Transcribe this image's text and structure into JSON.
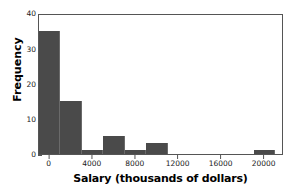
{
  "chart_data": {
    "type": "bar",
    "title": "",
    "subtitle": "",
    "xlabel": "Salary (thousands of dollars)",
    "ylabel": "Frequency",
    "xlim": [
      -1000,
      21800
    ],
    "ylim": [
      0,
      40
    ],
    "grid": false,
    "legend": null,
    "bin_width": 2000,
    "bar_color": "#4a4a4a",
    "frame_color": "#555555",
    "x_ticks": [
      0,
      4000,
      8000,
      12000,
      16000,
      20000
    ],
    "x_tick_labels": [
      "0",
      "4000",
      "8000",
      "12000",
      "16000",
      "20000"
    ],
    "y_ticks": [
      0,
      10,
      20,
      30,
      40
    ],
    "y_tick_labels": [
      "0",
      "10",
      "20",
      "30",
      "40"
    ],
    "bins": [
      {
        "start": -1000,
        "end": 1000,
        "value": 35
      },
      {
        "start": 1000,
        "end": 3000,
        "value": 15
      },
      {
        "start": 3000,
        "end": 5000,
        "value": 1
      },
      {
        "start": 5000,
        "end": 7000,
        "value": 5
      },
      {
        "start": 7000,
        "end": 9000,
        "value": 1
      },
      {
        "start": 9000,
        "end": 11000,
        "value": 3
      },
      {
        "start": 11000,
        "end": 13000,
        "value": 0
      },
      {
        "start": 13000,
        "end": 15000,
        "value": 0
      },
      {
        "start": 15000,
        "end": 17000,
        "value": 0
      },
      {
        "start": 17000,
        "end": 19000,
        "value": 0
      },
      {
        "start": 19000,
        "end": 21000,
        "value": 1
      }
    ],
    "categories": [
      "-1000 to 1000",
      "1000 to 3000",
      "3000 to 5000",
      "5000 to 7000",
      "7000 to 9000",
      "9000 to 11000",
      "11000 to 13000",
      "13000 to 15000",
      "15000 to 17000",
      "17000 to 19000",
      "19000 to 21000"
    ],
    "values": [
      35,
      15,
      1,
      5,
      1,
      3,
      0,
      0,
      0,
      0,
      1
    ]
  }
}
